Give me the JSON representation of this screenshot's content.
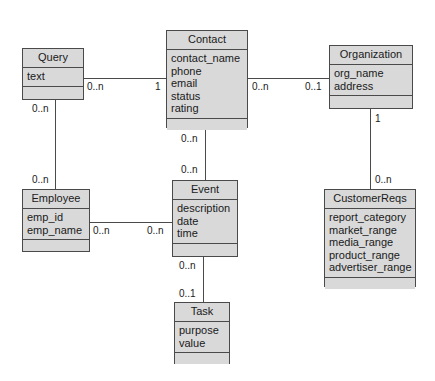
{
  "diagram": {
    "background_color": "#ffffff",
    "class_fill_color": "#d9d9d9",
    "class_border_color": "#4a4a4a",
    "text_color": "#1a1a1a"
  },
  "classes": [
    {
      "id": "query",
      "name": "Query",
      "attributes": [
        "text"
      ],
      "operations": [],
      "x": 22,
      "y": 48,
      "w": 62,
      "h": 52
    },
    {
      "id": "contact",
      "name": "Contact",
      "attributes": [
        "contact_name",
        "phone",
        "email",
        "status",
        "rating"
      ],
      "operations": [],
      "x": 166,
      "y": 30,
      "w": 82,
      "h": 98
    },
    {
      "id": "organization",
      "name": "Organization",
      "attributes": [
        "org_name",
        "address"
      ],
      "operations": [],
      "x": 329,
      "y": 45,
      "w": 84,
      "h": 64
    },
    {
      "id": "employee",
      "name": "Employee",
      "attributes": [
        "emp_id",
        "emp_name"
      ],
      "operations": [],
      "x": 22,
      "y": 189,
      "w": 68,
      "h": 63
    },
    {
      "id": "event",
      "name": "Event",
      "attributes": [
        "description",
        "date",
        "time"
      ],
      "operations": [],
      "x": 172,
      "y": 180,
      "w": 66,
      "h": 77
    },
    {
      "id": "customerreqs",
      "name": "CustomerReqs",
      "attributes": [
        "report_category",
        "market_range",
        "media_range",
        "product_range",
        "advertiser_range"
      ],
      "operations": [],
      "x": 324,
      "y": 189,
      "w": 92,
      "h": 98
    },
    {
      "id": "task",
      "name": "Task",
      "attributes": [
        "purpose",
        "value"
      ],
      "operations": [],
      "x": 174,
      "y": 302,
      "w": 56,
      "h": 62
    }
  ],
  "associations": [
    {
      "id": "query-contact",
      "from": "query",
      "to": "contact",
      "from_multiplicity": "0..n",
      "to_multiplicity": "1"
    },
    {
      "id": "contact-organization",
      "from": "contact",
      "to": "organization",
      "from_multiplicity": "0..n",
      "to_multiplicity": "0..1"
    },
    {
      "id": "query-employee",
      "from": "query",
      "to": "employee",
      "from_multiplicity": "0..n",
      "to_multiplicity": "0..n"
    },
    {
      "id": "contact-event",
      "from": "contact",
      "to": "event",
      "from_multiplicity": "0..n",
      "to_multiplicity": "0..n"
    },
    {
      "id": "organization-customerreqs",
      "from": "organization",
      "to": "customerreqs",
      "from_multiplicity": "1",
      "to_multiplicity": "0..n"
    },
    {
      "id": "employee-event",
      "from": "employee",
      "to": "event",
      "from_multiplicity": "0..n",
      "to_multiplicity": "0..n"
    },
    {
      "id": "event-task",
      "from": "event",
      "to": "task",
      "from_multiplicity": "0..n",
      "to_multiplicity": "0..1"
    }
  ],
  "multiplicity_labels": {
    "query_to_contact": "0..n",
    "contact_from_query": "1",
    "contact_to_organization": "0..n",
    "organization_from_contact": "0..1",
    "query_to_employee": "0..n",
    "employee_from_query": "0..n",
    "contact_to_event": "0..n",
    "event_from_contact": "0..n",
    "organization_to_customerreqs": "1",
    "customerreqs_from_organization": "0..n",
    "employee_to_event": "0..n",
    "event_from_employee": "0..n",
    "event_to_task": "0..n",
    "task_from_event": "0..1"
  }
}
